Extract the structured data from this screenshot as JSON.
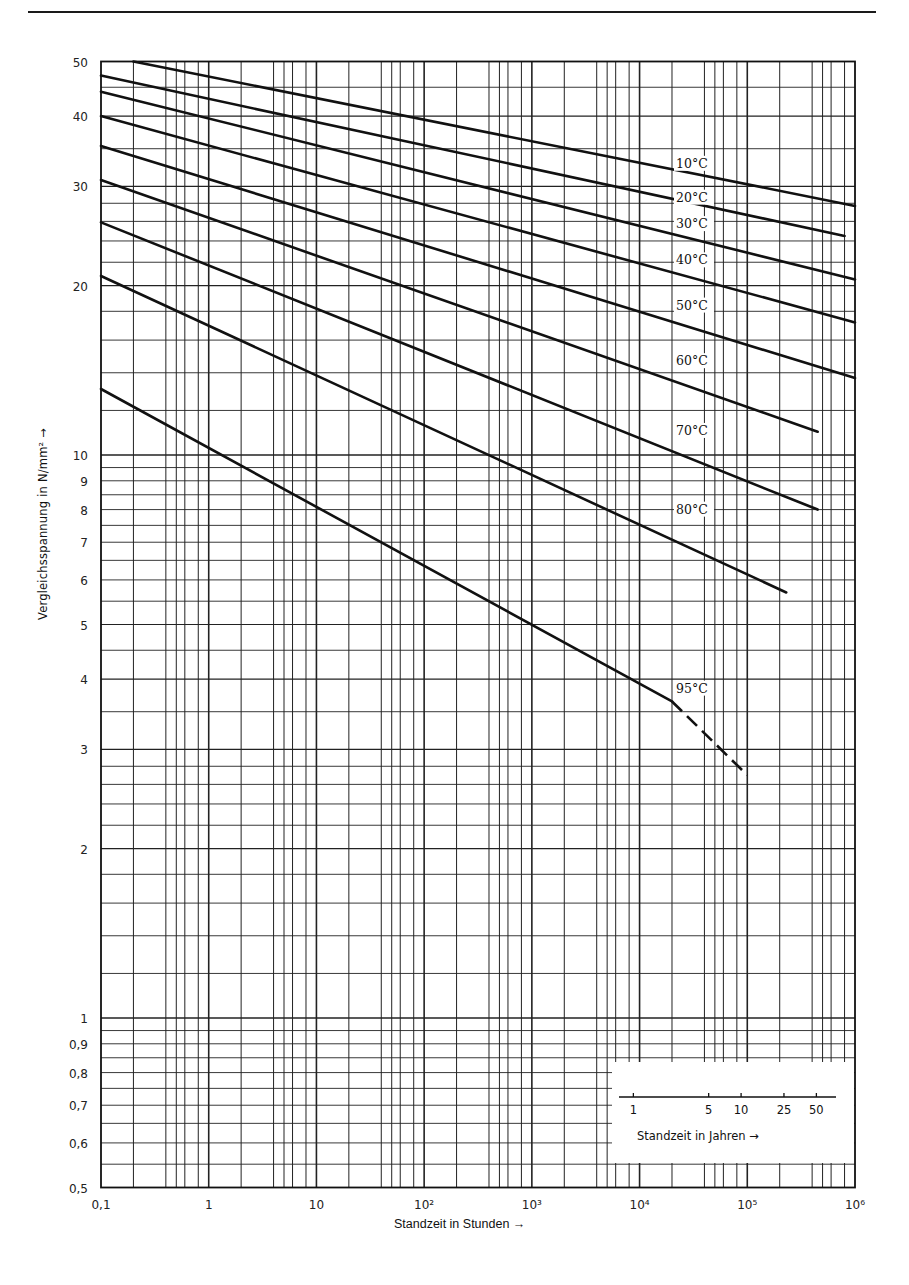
{
  "chart_data": {
    "type": "line",
    "title": "",
    "xlabel": "Standzeit in Stunden",
    "ylabel": "Vergleichsspannung in N/mm²",
    "xscale": "log",
    "yscale": "log",
    "xlim": [
      0.1,
      1000000
    ],
    "ylim": [
      0.5,
      50
    ],
    "grid": true,
    "x_tick_labels": [
      "0,1",
      "1",
      "10",
      "10²",
      "10³",
      "10⁴",
      "10⁵",
      "10⁶"
    ],
    "x_tick_values": [
      0.1,
      1,
      10,
      100,
      1000,
      10000,
      100000,
      1000000
    ],
    "y_tick_labels": [
      "0,5",
      "0,6",
      "0,7",
      "0,8",
      "0,9",
      "1",
      "2",
      "3",
      "4",
      "5",
      "6",
      "7",
      "8",
      "9",
      "10",
      "20",
      "30",
      "40",
      "50"
    ],
    "y_tick_values": [
      0.5,
      0.6,
      0.7,
      0.8,
      0.9,
      1,
      2,
      3,
      4,
      5,
      6,
      7,
      8,
      9,
      10,
      20,
      30,
      40,
      50
    ],
    "secondary_x_axis": {
      "label": "Standzeit in Jahren",
      "tick_labels": [
        "1",
        "5",
        "10",
        "25",
        "50"
      ],
      "tick_values_years": [
        1,
        5,
        10,
        25,
        50
      ],
      "position": "inset lower right"
    },
    "series": [
      {
        "name": "10°C",
        "x": [
          0.2,
          1000000
        ],
        "y": [
          50,
          27.7
        ]
      },
      {
        "name": "20°C",
        "x": [
          0.1,
          800000
        ],
        "y": [
          47.2,
          24.5
        ]
      },
      {
        "name": "30°C",
        "x": [
          0.1,
          1000000
        ],
        "y": [
          44.2,
          20.5
        ]
      },
      {
        "name": "40°C",
        "x": [
          0.1,
          1000000
        ],
        "y": [
          40,
          17.2
        ]
      },
      {
        "name": "50°C",
        "x": [
          0.1,
          1000000
        ],
        "y": [
          35.4,
          13.7
        ]
      },
      {
        "name": "60°C",
        "x": [
          0.1,
          450000
        ],
        "y": [
          30.8,
          11
        ]
      },
      {
        "name": "70°C",
        "x": [
          0.1,
          450000
        ],
        "y": [
          25.9,
          8.0
        ]
      },
      {
        "name": "80°C",
        "x": [
          0.1,
          230000
        ],
        "y": [
          20.8,
          5.7
        ]
      },
      {
        "name": "95°C",
        "x": [
          0.1,
          20000
        ],
        "y": [
          13.1,
          3.65
        ],
        "extrapolated": {
          "x": [
            20000,
            100000
          ],
          "y": [
            3.65,
            2.7
          ],
          "style": "dashed"
        }
      }
    ],
    "annotations": [
      {
        "text": "10°C",
        "x": 20000,
        "y": 32.5
      },
      {
        "text": "20°C",
        "x": 20000,
        "y": 28.3
      },
      {
        "text": "30°C",
        "x": 20000,
        "y": 25.4
      },
      {
        "text": "40°C",
        "x": 20000,
        "y": 21.9
      },
      {
        "text": "50°C",
        "x": 20000,
        "y": 18.2
      },
      {
        "text": "60°C",
        "x": 20000,
        "y": 14.5
      },
      {
        "text": "70°C",
        "x": 20000,
        "y": 10.9
      },
      {
        "text": "80°C",
        "x": 20000,
        "y": 7.9
      },
      {
        "text": "95°C",
        "x": 20000,
        "y": 3.8
      }
    ]
  },
  "labels": {
    "x_axis": "Standzeit in Stunden",
    "y_axis": "Vergleichsspannung in N/mm²",
    "years_axis": "Standzeit in Jahren"
  }
}
